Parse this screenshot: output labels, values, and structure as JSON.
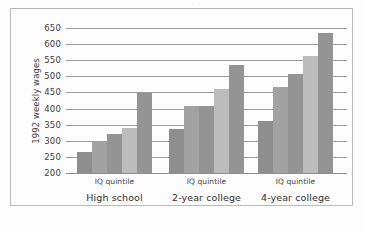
{
  "figure": {
    "background": "#fdfdfd",
    "frame_color": "#b9b9b9",
    "top_bleed_text": "· · ·   · · ·   · · ·   · · ·"
  },
  "chart_data": {
    "type": "bar",
    "title": "",
    "xlabel": "IQ quintile",
    "ylabel": "1992 weekly wages",
    "ylim": [
      200,
      650
    ],
    "ytick_step": 50,
    "yticks": [
      650,
      600,
      550,
      500,
      450,
      400,
      350,
      300,
      250,
      200
    ],
    "ytick_labels": [
      "650",
      "600",
      "550",
      "500",
      "450",
      "400",
      "350",
      "300",
      "250",
      "200"
    ],
    "grid": true,
    "grid_axis": "y",
    "legend": false,
    "legend_position": "none",
    "categories": [
      "High school",
      "2-year college",
      "4-year college"
    ],
    "category_axis_label": "IQ quintile",
    "series": [
      {
        "name": "1st quintile",
        "color": "#8e8e8e",
        "values": [
          265,
          338,
          360
        ]
      },
      {
        "name": "2nd quintile",
        "color": "#a2a2a2",
        "values": [
          295,
          408,
          467
        ]
      },
      {
        "name": "3rd quintile",
        "color": "#949494",
        "values": [
          320,
          408,
          507
        ]
      },
      {
        "name": "4th quintile",
        "color": "#bcbcbc",
        "values": [
          340,
          460,
          563
        ]
      },
      {
        "name": "5th quintile",
        "color": "#949494",
        "values": [
          448,
          535,
          635
        ]
      }
    ],
    "groups": [
      {
        "label": "High school",
        "axis_label": "IQ quintile",
        "bars": [
          {
            "quintile": "1st quintile",
            "value": 265,
            "color": "#8e8e8e"
          },
          {
            "quintile": "2nd quintile",
            "value": 295,
            "color": "#a2a2a2"
          },
          {
            "quintile": "3rd quintile",
            "value": 320,
            "color": "#949494"
          },
          {
            "quintile": "4th quintile",
            "value": 340,
            "color": "#bcbcbc"
          },
          {
            "quintile": "5th quintile",
            "value": 448,
            "color": "#949494"
          }
        ]
      },
      {
        "label": "2-year college",
        "axis_label": "IQ quintile",
        "bars": [
          {
            "quintile": "1st quintile",
            "value": 338,
            "color": "#8e8e8e"
          },
          {
            "quintile": "2nd quintile",
            "value": 408,
            "color": "#a2a2a2"
          },
          {
            "quintile": "3rd quintile",
            "value": 408,
            "color": "#949494"
          },
          {
            "quintile": "4th quintile",
            "value": 460,
            "color": "#bcbcbc"
          },
          {
            "quintile": "5th quintile",
            "value": 535,
            "color": "#949494"
          }
        ]
      },
      {
        "label": "4-year college",
        "axis_label": "IQ quintile",
        "bars": [
          {
            "quintile": "1st quintile",
            "value": 360,
            "color": "#8e8e8e"
          },
          {
            "quintile": "2nd quintile",
            "value": 467,
            "color": "#a2a2a2"
          },
          {
            "quintile": "3rd quintile",
            "value": 507,
            "color": "#949494"
          },
          {
            "quintile": "4th quintile",
            "value": 563,
            "color": "#bcbcbc"
          },
          {
            "quintile": "5th quintile",
            "value": 635,
            "color": "#949494"
          }
        ]
      }
    ]
  }
}
